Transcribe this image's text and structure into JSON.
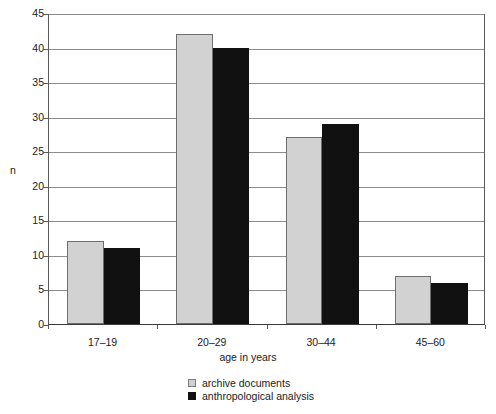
{
  "chart_data": {
    "type": "bar",
    "title": "",
    "subtitle": "",
    "xlabel": "age in years",
    "ylabel": "n",
    "categories": [
      "17–19",
      "20–29",
      "30–44",
      "45–60"
    ],
    "series": [
      {
        "name": "archive documents",
        "color": "#d2d2d2",
        "values": [
          12,
          42,
          27,
          7
        ]
      },
      {
        "name": "anthropological analysis",
        "color": "#111111",
        "values": [
          11,
          40,
          29,
          6
        ]
      }
    ],
    "ylim": [
      0,
      45
    ],
    "ytick_values": [
      0,
      5,
      10,
      15,
      20,
      25,
      30,
      35,
      40,
      45
    ],
    "ytick_labels": [
      "0",
      "5",
      "10",
      "15",
      "20",
      "25",
      "30",
      "35",
      "40",
      "45"
    ],
    "grid": "horizontal",
    "legend_position": "bottom-center",
    "frame": "box"
  },
  "legend": {
    "entries": [
      {
        "label": "archive documents",
        "swatch": "light-gray-square"
      },
      {
        "label": "anthropological analysis",
        "swatch": "black-square"
      }
    ]
  }
}
